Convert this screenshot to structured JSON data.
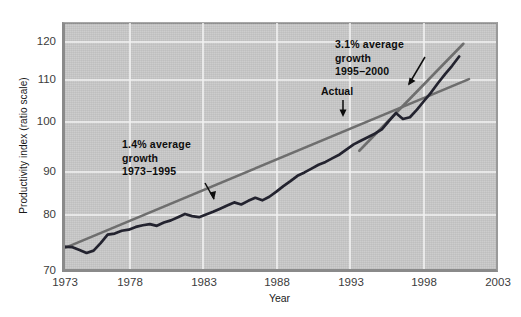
{
  "chart_data": {
    "type": "line",
    "title": "",
    "xlabel": "Year",
    "ylabel": "Productivity index (ratio scale)",
    "xlim": [
      1972,
      2003
    ],
    "ylim": [
      70,
      124
    ],
    "xticks": [
      "1973",
      "1978",
      "1983",
      "1988",
      "1993",
      "1998",
      "2003"
    ],
    "yticks": [
      "70",
      "80",
      "90",
      "100",
      "110",
      "120"
    ],
    "grid": true,
    "legend": "none",
    "scale": "ratio (log)",
    "colors": {
      "plot_background": "#c9c9c9",
      "gridline": "#f0f0f0",
      "actual_line": "#1d1d2e",
      "trend_line": "#6e6e6e",
      "text": "#1a1a1a"
    },
    "series": [
      {
        "name": "Actual",
        "kind": "actual",
        "x": [
          1972.3,
          1973,
          1973.5,
          1974,
          1974.5,
          1975,
          1975.5,
          1976,
          1976.5,
          1977,
          1977.5,
          1978,
          1978.5,
          1979,
          1979.5,
          1980,
          1980.5,
          1981,
          1981.5,
          1982,
          1982.5,
          1983,
          1983.5,
          1984,
          1984.5,
          1985,
          1985.5,
          1986,
          1986.5,
          1987,
          1987.5,
          1988,
          1988.5,
          1989,
          1989.5,
          1990,
          1990.5,
          1991,
          1991.5,
          1992,
          1992.5,
          1993,
          1993.5,
          1994,
          1994.5,
          1995,
          1995.5,
          1996,
          1996.5,
          1997,
          1997.5,
          1998,
          1998.5,
          1999,
          1999.5,
          2000,
          2000.5
        ],
        "y": [
          74.3,
          74.2,
          73.7,
          73.2,
          73.6,
          74.9,
          76.4,
          76.6,
          77.1,
          77.3,
          77.8,
          78.1,
          78.3,
          78.0,
          78.6,
          79.0,
          79.6,
          80.2,
          79.8,
          79.6,
          80.1,
          80.6,
          81.2,
          81.8,
          82.4,
          82.0,
          82.7,
          83.3,
          82.8,
          83.5,
          84.5,
          85.6,
          86.6,
          87.7,
          88.4,
          89.2,
          90.0,
          90.6,
          91.4,
          92.2,
          93.3,
          94.4,
          95.2,
          96.0,
          96.8,
          97.8,
          99.7,
          101.6,
          100.2,
          100.6,
          102.4,
          104.5,
          106.6,
          109.0,
          111.3,
          113.5,
          116.0
        ]
      },
      {
        "name": "1.4% average growth trend 1973-1995",
        "kind": "trend",
        "x": [
          1972.3,
          2001.2
        ],
        "y": [
          73.9,
          110.0
        ],
        "rate": "1.4%",
        "period": "1973-1995"
      },
      {
        "name": "3.1% average growth trend 1995-2000",
        "kind": "trend",
        "x": [
          1993.4,
          2000.8
        ],
        "y": [
          93.0,
          119.5
        ],
        "rate": "3.1%",
        "period": "1995-2000"
      }
    ],
    "annotations": [
      {
        "id": "growth-1973-1995",
        "lines": [
          "1.4% average",
          "growth",
          "1973–1995"
        ],
        "text": "1.4% average growth 1973–1995"
      },
      {
        "id": "growth-1995-2000",
        "lines": [
          "3.1% average",
          "growth",
          "1995–2000"
        ],
        "text": "3.1% average growth 1995–2000"
      },
      {
        "id": "actual-callout",
        "lines": [
          "Actual"
        ],
        "text": "Actual"
      }
    ]
  },
  "axis": {
    "y_title": "Productivity index (ratio scale)",
    "x_title": "Year",
    "yticks": [
      "120",
      "110",
      "100",
      "90",
      "80",
      "70"
    ],
    "xticks": [
      "1973",
      "1978",
      "1983",
      "1988",
      "1993",
      "1998",
      "2003"
    ]
  },
  "annotations": {
    "growth_1973_1995": {
      "line1": "1.4% average",
      "line2": "growth",
      "line3": "1973–1995"
    },
    "growth_1995_2000": {
      "line1": "3.1% average",
      "line2": "growth",
      "line3": "1995–2000"
    },
    "actual": "Actual"
  }
}
